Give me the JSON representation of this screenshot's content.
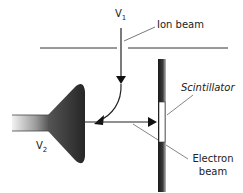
{
  "diagram": {
    "labels": {
      "v1": {
        "main": "V",
        "sub": "1"
      },
      "v2": {
        "main": "V",
        "sub": "2"
      },
      "ion_beam": "Ion beam",
      "scintillator": "Scintillator",
      "electron_beam_line1": "Electron",
      "electron_beam_line2": "beam"
    },
    "colors": {
      "line": "#333333",
      "electrode_dark": "#2a2a2a",
      "scintillator": "#ffffff",
      "leader": "#666666"
    }
  }
}
